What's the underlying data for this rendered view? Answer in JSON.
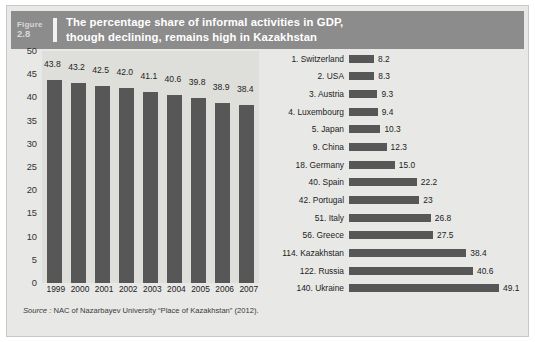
{
  "figure": {
    "label_word": "Figure",
    "number": "2.8",
    "title_line1": "The percentage share of informal activities in GDP,",
    "title_line2": "though declining, remains high in Kazakhstan",
    "source_prefix": "Source :",
    "source_text": "NAC of Nazarbayev University “Place of Kazakhstan” (2012)."
  },
  "colors": {
    "header_band": "#8c8c8c",
    "frame_bg": "#e8e8e6",
    "left_plot_bg": "#dededa",
    "bar_fill": "#575757",
    "title_text": "#ffffff"
  },
  "chart_data": [
    {
      "type": "bar",
      "id": "informal-share-by-year",
      "title": "",
      "xlabel": "",
      "ylabel": "",
      "orientation": "vertical",
      "ylim": [
        0,
        50
      ],
      "yticks": [
        50,
        45,
        40,
        35,
        30,
        25,
        20,
        15,
        10,
        5,
        0
      ],
      "grid": false,
      "legend": "none",
      "categories": [
        "1999",
        "2000",
        "2001",
        "2002",
        "2003",
        "2004",
        "2005",
        "2006",
        "2007"
      ],
      "values": [
        43.8,
        43.2,
        42.5,
        42.0,
        41.1,
        40.6,
        39.8,
        38.9,
        38.4
      ],
      "value_labels": [
        "43.8",
        "43.2",
        "42.5",
        "42.0",
        "41.1",
        "40.6",
        "39.8",
        "38.9",
        "38.4"
      ]
    },
    {
      "type": "bar",
      "id": "informal-share-by-country-rank",
      "title": "",
      "xlabel": "",
      "ylabel": "",
      "orientation": "horizontal",
      "xlim": [
        0,
        49.1
      ],
      "grid": false,
      "legend": "none",
      "categories": [
        "1. Switzerland",
        "2. USA",
        "3. Austria",
        "4. Luxembourg",
        "5. Japan",
        "9. China",
        "18. Germany",
        "40. Spain",
        "42. Portugal",
        "51. Italy",
        "56. Greece",
        "114. Kazakhstan",
        "122. Russia",
        "140. Ukraine"
      ],
      "values": [
        8.2,
        8.3,
        9.3,
        9.4,
        10.3,
        12.3,
        15.0,
        22.2,
        23,
        26.8,
        27.5,
        38.4,
        40.6,
        49.1
      ],
      "value_labels": [
        "8.2",
        "8.3",
        "9.3",
        "9.4",
        "10.3",
        "12.3",
        "15.0",
        "22.2",
        "23",
        "26.8",
        "27.5",
        "38.4",
        "40.6",
        "49.1"
      ]
    }
  ]
}
